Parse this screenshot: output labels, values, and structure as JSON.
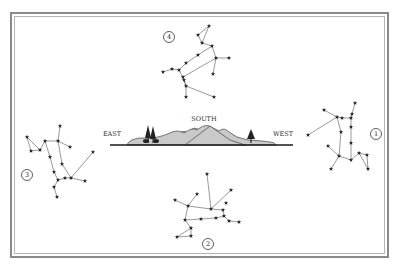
{
  "diagram": {
    "width": 402,
    "height": 269,
    "colors": {
      "background": "#ffffff",
      "frame": "#8a8a8a",
      "line": "#555555",
      "star": "#222222",
      "hill_fill": "#c9c9c9",
      "hill_stroke": "#555555",
      "ground": "#1a1a1a",
      "tree": "#222222",
      "label": "#333333"
    },
    "horizon": {
      "directions": [
        {
          "label": "EAST",
          "x": 112,
          "y": 136
        },
        {
          "label": "SOUTH",
          "x": 204,
          "y": 121
        },
        {
          "label": "WEST",
          "x": 283,
          "y": 136
        }
      ],
      "ground_line": {
        "x1": 110,
        "x2": 293,
        "y": 145
      }
    },
    "constellations": [
      {
        "id": "4",
        "label": "4",
        "label_pos": [
          169,
          37
        ],
        "stars": [
          [
            209,
            26
          ],
          [
            198,
            35
          ],
          [
            202,
            43
          ],
          [
            212,
            46
          ],
          [
            198,
            55
          ],
          [
            186,
            63
          ],
          [
            216,
            58
          ],
          [
            229,
            58
          ],
          [
            179,
            70
          ],
          [
            172,
            69
          ],
          [
            163,
            72
          ],
          [
            183,
            77
          ],
          [
            213,
            74
          ],
          [
            184,
            80
          ],
          [
            186,
            86
          ],
          [
            214,
            97
          ],
          [
            186,
            97
          ]
        ],
        "lines": [
          [
            0,
            1
          ],
          [
            1,
            2
          ],
          [
            0,
            2
          ],
          [
            2,
            3
          ],
          [
            3,
            4
          ],
          [
            4,
            5
          ],
          [
            5,
            8
          ],
          [
            3,
            6
          ],
          [
            6,
            7
          ],
          [
            6,
            12
          ],
          [
            6,
            11
          ],
          [
            11,
            14
          ],
          [
            8,
            9
          ],
          [
            9,
            10
          ],
          [
            8,
            13
          ],
          [
            13,
            14
          ],
          [
            14,
            15
          ],
          [
            14,
            16
          ]
        ]
      },
      {
        "id": "1",
        "label": "1",
        "label_pos": [
          376,
          134
        ],
        "stars": [
          [
            355,
            103
          ],
          [
            352,
            114
          ],
          [
            324,
            110
          ],
          [
            337,
            117
          ],
          [
            342,
            118
          ],
          [
            351,
            118
          ],
          [
            308,
            135
          ],
          [
            341,
            132
          ],
          [
            351,
            127
          ],
          [
            351,
            143
          ],
          [
            328,
            146
          ],
          [
            339,
            156
          ],
          [
            351,
            160
          ],
          [
            359,
            153
          ],
          [
            367,
            155
          ],
          [
            368,
            169
          ],
          [
            331,
            169
          ]
        ],
        "lines": [
          [
            0,
            1
          ],
          [
            1,
            5
          ],
          [
            2,
            3
          ],
          [
            3,
            4
          ],
          [
            4,
            5
          ],
          [
            3,
            6
          ],
          [
            3,
            7
          ],
          [
            7,
            11
          ],
          [
            5,
            8
          ],
          [
            8,
            9
          ],
          [
            9,
            12
          ],
          [
            10,
            11
          ],
          [
            11,
            12
          ],
          [
            11,
            16
          ],
          [
            12,
            13
          ],
          [
            13,
            14
          ],
          [
            14,
            15
          ],
          [
            13,
            15
          ]
        ]
      },
      {
        "id": "3",
        "label": "3",
        "label_pos": [
          27,
          175
        ],
        "stars": [
          [
            60,
            126
          ],
          [
            27,
            137
          ],
          [
            31,
            151
          ],
          [
            40,
            150
          ],
          [
            45,
            141
          ],
          [
            58,
            141
          ],
          [
            70,
            147
          ],
          [
            93,
            152
          ],
          [
            50,
            157
          ],
          [
            62,
            164
          ],
          [
            54,
            172
          ],
          [
            71,
            178
          ],
          [
            58,
            180
          ],
          [
            65,
            178
          ],
          [
            85,
            181
          ],
          [
            54,
            187
          ],
          [
            57,
            197
          ]
        ],
        "lines": [
          [
            0,
            5
          ],
          [
            1,
            2
          ],
          [
            2,
            3
          ],
          [
            1,
            3
          ],
          [
            3,
            4
          ],
          [
            4,
            5
          ],
          [
            5,
            6
          ],
          [
            5,
            9
          ],
          [
            9,
            11
          ],
          [
            4,
            8
          ],
          [
            8,
            10
          ],
          [
            10,
            12
          ],
          [
            12,
            13
          ],
          [
            13,
            11
          ],
          [
            11,
            14
          ],
          [
            11,
            7
          ],
          [
            12,
            15
          ],
          [
            15,
            16
          ]
        ]
      },
      {
        "id": "2",
        "label": "2",
        "label_pos": [
          208,
          244
        ],
        "stars": [
          [
            207,
            174
          ],
          [
            231,
            190
          ],
          [
            197,
            194
          ],
          [
            175,
            200
          ],
          [
            188,
            206
          ],
          [
            226,
            203
          ],
          [
            211,
            209
          ],
          [
            223,
            210
          ],
          [
            185,
            220
          ],
          [
            201,
            219
          ],
          [
            216,
            218
          ],
          [
            224,
            216
          ],
          [
            229,
            221
          ],
          [
            239,
            222
          ],
          [
            191,
            228
          ],
          [
            177,
            237
          ],
          [
            191,
            236
          ]
        ],
        "lines": [
          [
            0,
            6
          ],
          [
            1,
            6
          ],
          [
            6,
            7
          ],
          [
            4,
            6
          ],
          [
            3,
            4
          ],
          [
            2,
            4
          ],
          [
            4,
            8
          ],
          [
            7,
            11
          ],
          [
            8,
            9
          ],
          [
            9,
            10
          ],
          [
            10,
            11
          ],
          [
            11,
            12
          ],
          [
            12,
            13
          ],
          [
            8,
            14
          ],
          [
            14,
            15
          ],
          [
            15,
            16
          ],
          [
            14,
            16
          ]
        ]
      }
    ]
  }
}
